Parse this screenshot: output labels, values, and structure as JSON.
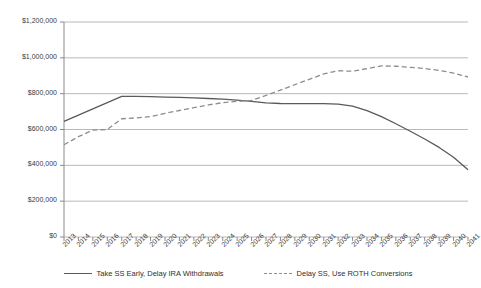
{
  "chart_data": {
    "type": "line",
    "title": "",
    "xlabel": "",
    "ylabel": "",
    "grid": true,
    "legend_position": "bottom",
    "ylim": [
      0,
      1200000
    ],
    "ytick_values": [
      0,
      200000,
      400000,
      600000,
      800000,
      1000000,
      1200000
    ],
    "ytick_labels": [
      "$0",
      "$200,000",
      "$400,000",
      "$600,000",
      "$800,000",
      "$1,000,000",
      "$1,200,000"
    ],
    "categories": [
      "2013",
      "2014",
      "2015",
      "2016",
      "2017",
      "2018",
      "2019",
      "2020",
      "2021",
      "2022",
      "2023",
      "2024",
      "2025",
      "2026",
      "2027",
      "2028",
      "2029",
      "2030",
      "2031",
      "2032",
      "2033",
      "2034",
      "2035",
      "2036",
      "2037",
      "2038",
      "2039",
      "2040",
      "2041"
    ],
    "series": [
      {
        "name": "Take SS Early, Delay IRA Withdrawals",
        "style": "solid",
        "color": "#5a5a5a",
        "values": [
          645000,
          680000,
          715000,
          750000,
          785000,
          785000,
          783000,
          781000,
          779000,
          776000,
          773000,
          769000,
          764000,
          757000,
          749000,
          745000,
          744000,
          744000,
          744000,
          742000,
          730000,
          705000,
          672000,
          632000,
          590000,
          547000,
          500000,
          445000,
          375000
        ]
      },
      {
        "name": "Delay SS, Use ROTH Conversions",
        "style": "dashed",
        "color": "#8d8d8d",
        "values": [
          515000,
          560000,
          597000,
          600000,
          660000,
          665000,
          672000,
          690000,
          706000,
          722000,
          737000,
          750000,
          757000,
          762000,
          790000,
          820000,
          850000,
          880000,
          910000,
          928000,
          925000,
          940000,
          955000,
          953000,
          947000,
          940000,
          930000,
          915000,
          893000
        ]
      }
    ]
  },
  "legend": {
    "entries": [
      {
        "label": "Take SS Early, Delay IRA Withdrawals",
        "style": "solid"
      },
      {
        "label": "Delay SS, Use ROTH Conversions",
        "style": "dashed"
      }
    ]
  },
  "colors": {
    "series_solid": "#5a5a5a",
    "series_dashed": "#8d8d8d",
    "gridline": "#b9b9b9",
    "axis": "#8a8a8a",
    "text": "#3a3a3a",
    "background": "#ffffff"
  }
}
